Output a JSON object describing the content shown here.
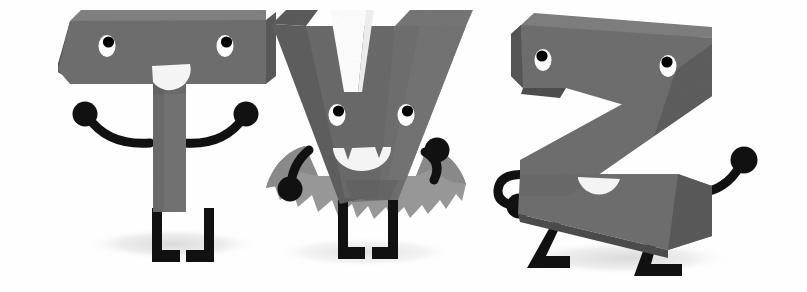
{
  "illustration": {
    "title": "Cartoon 3D Letter Characters",
    "subtitle": "T V Z alphabet mascots",
    "background_color": "#fefefe",
    "style": "flat vector cartoon with isometric extrusion and paper grain texture"
  },
  "palette": {
    "letter_front": "#6f6f6f",
    "letter_front_alt": "#737373",
    "letter_top_light": "#7b7b7b",
    "letter_side_dark": "#565656",
    "letter_side_darker": "#4b4b4b",
    "cape_fill": "#9a9a9a",
    "cape_shade": "#8a8a8a",
    "limb_black": "#111111",
    "eye_white": "#ffffff",
    "pupil_black": "#000000",
    "mouth_white": "#f2f2f2",
    "ground_shadow": "#e4e4e4",
    "background": "#fefefe"
  },
  "characters": [
    {
      "id": "letter-t",
      "letter": "T",
      "name": "Tee the letter T character",
      "costume": "none",
      "pose": "standing with both arms raised outward",
      "x": 55,
      "y": 8,
      "width": 215,
      "height": 250,
      "eyes": 2,
      "eye_style": "white oval with black pupil looking up",
      "mouth": "open half-circle smile",
      "has_cape": false,
      "arms": 2,
      "legs": 2,
      "shadow": true
    },
    {
      "id": "letter-v",
      "letter": "V",
      "name": "Vee the vampire letter V character",
      "costume": "vampire cape with bat-wing scalloped edge",
      "pose": "standing with arms bent, cape spread",
      "x": 265,
      "y": 4,
      "width": 220,
      "height": 258,
      "eyes": 2,
      "eye_style": "white oval with black pupil looking up",
      "mouth": "open smile with two pointed fangs",
      "has_cape": true,
      "arms": 2,
      "legs": 2,
      "shadow": true
    },
    {
      "id": "letter-z",
      "letter": "Z",
      "name": "Zee the letter Z character",
      "costume": "none",
      "pose": "walking, left hand on hip, right arm raised",
      "x": 490,
      "y": 10,
      "width": 300,
      "height": 265,
      "eyes": 2,
      "eye_style": "white oval with black pupil looking up",
      "mouth": "open half-circle smile",
      "has_cape": false,
      "arms": 2,
      "legs": 2,
      "shadow": true
    }
  ],
  "alt_text": "Three friendly cartoon letters T, V and Z drawn as grey three-dimensional blocks with cartoon eyes, smiling mouths and thin black arms and legs. The V wears a vampire cape and has fangs."
}
